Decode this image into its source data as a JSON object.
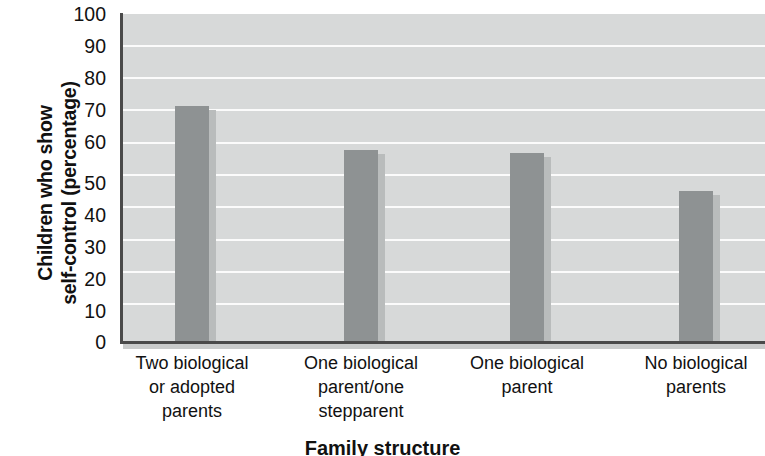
{
  "chart_data": {
    "type": "bar",
    "title": "",
    "xlabel": "Family structure",
    "ylabel": "Children who show self-control (percentage)",
    "ylabel_line1": "Children who show",
    "ylabel_line2": "self-control (percentage)",
    "categories": [
      "Two biological or adopted parents",
      "One biological parent/one stepparent",
      "One biological parent",
      "No biological parents"
    ],
    "category_lines": [
      "Two biological\nor adopted\nparents",
      "One biological\nparent/one\nstepparent",
      "One biological\nparent",
      "No biological\nparents"
    ],
    "values": [
      72,
      58.5,
      57.5,
      46
    ],
    "ylim": [
      0,
      100
    ],
    "yticks": [
      100,
      90,
      80,
      70,
      60,
      50,
      40,
      30,
      20,
      10,
      0
    ],
    "ytick_labels": [
      "100",
      "90",
      "80",
      "70",
      "60",
      "50",
      "40",
      "30",
      "20",
      "10",
      "0"
    ],
    "grid": true,
    "grid_axis": "y",
    "legend": "none",
    "colors": {
      "bar": "#8e9293",
      "bar_shadow": "#b9bcbc",
      "plot_background": "#d7d9d9",
      "gridline": "#fbfbfb",
      "axis": "#4a4a4a",
      "text": "#111111",
      "page_background": "#ffffff"
    }
  }
}
